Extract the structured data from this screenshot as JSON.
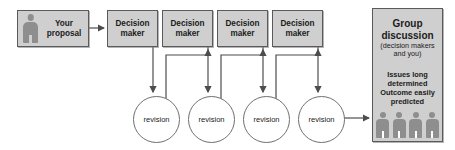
{
  "diagram": {
    "colors": {
      "box_fill": "#cfcfcf",
      "box_stroke": "#5a5a5a",
      "circle_fill": "#ffffff",
      "circle_stroke": "#707070",
      "connector": "#4d4d4d",
      "figure_fill": "#8e8e8e",
      "canvas": "#ffffff"
    },
    "proposal": {
      "label": "Your proposal",
      "icon": "person-icon"
    },
    "decision_makers": [
      {
        "label": "Decision maker"
      },
      {
        "label": "Decision maker"
      },
      {
        "label": "Decision maker"
      },
      {
        "label": "Decision maker"
      }
    ],
    "revisions": [
      {
        "label": "revision"
      },
      {
        "label": "revision"
      },
      {
        "label": "revision"
      },
      {
        "label": "revision"
      }
    ],
    "group": {
      "title": "Group discussion",
      "subtitle": "(decision makers and you)",
      "note": "Issues long determined Outcome easily predicted",
      "people_count": 4
    }
  }
}
